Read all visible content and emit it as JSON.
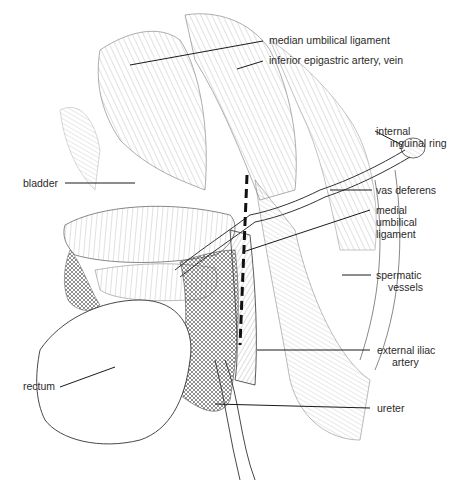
{
  "figure": {
    "labels": [
      {
        "id": "median-umbilical-ligament",
        "text": "median umbilical ligament"
      },
      {
        "id": "inferior-epigastric",
        "text": "inferior epigastric artery, vein"
      },
      {
        "id": "internal-inguinal-ring",
        "line1": "internal",
        "line2": "inguinal ring"
      },
      {
        "id": "bladder",
        "text": "bladder"
      },
      {
        "id": "vas-deferens",
        "text": "vas deferens"
      },
      {
        "id": "medial-umbilical-ligament",
        "line1": "medial",
        "line2": "umbilical",
        "line3": "ligament"
      },
      {
        "id": "spermatic-vessels",
        "line1": "spermatic",
        "line2": "vessels"
      },
      {
        "id": "rectum",
        "text": "rectum"
      },
      {
        "id": "external-iliac-artery",
        "line1": "external iliac",
        "line2": "artery"
      },
      {
        "id": "ureter",
        "text": "ureter"
      }
    ],
    "colors": {
      "line": "#1a1a1a",
      "hatch": "#555555",
      "text": "#2a2a2a",
      "background": "#ffffff"
    }
  }
}
